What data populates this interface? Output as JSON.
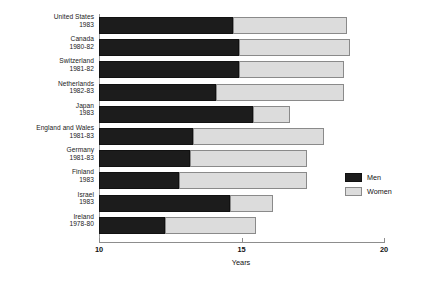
{
  "chart_data": {
    "type": "bar",
    "orientation": "horizontal",
    "stacked": true,
    "title": "",
    "xlabel": "Years",
    "ylabel": "",
    "xlim": [
      10,
      20
    ],
    "xticks": [
      10,
      15,
      20
    ],
    "xtick_labels": [
      "10",
      "15",
      "20"
    ],
    "grid": false,
    "legend_position": "right-inside",
    "categories": [
      "United States 1983",
      "Canada 1980-82",
      "Switzerland 1981-82",
      "Netherlands 1982-83",
      "Japan 1983",
      "England and Wales 1981-83",
      "Germany 1981-83",
      "Finland 1983",
      "Israel 1983",
      "Ireland 1978-80"
    ],
    "category_lines": [
      {
        "country": "United States",
        "period": "1983"
      },
      {
        "country": "Canada",
        "period": "1980-82"
      },
      {
        "country": "Switzerland",
        "period": "1981-82"
      },
      {
        "country": "Netherlands",
        "period": "1982-83"
      },
      {
        "country": "Japan",
        "period": "1983"
      },
      {
        "country": "England and Wales",
        "period": "1981-83"
      },
      {
        "country": "Germany",
        "period": "1981-83"
      },
      {
        "country": "Finland",
        "period": "1983"
      },
      {
        "country": "Israel",
        "period": "1983"
      },
      {
        "country": "Ireland",
        "period": "1978-80"
      }
    ],
    "series": [
      {
        "name": "Men",
        "color": "#1c1c1c",
        "values": [
          14.7,
          14.9,
          14.9,
          14.1,
          15.4,
          13.3,
          13.2,
          12.8,
          14.6,
          12.3
        ]
      },
      {
        "name": "Women",
        "color": "#dcdcdc",
        "values": [
          18.7,
          18.8,
          18.6,
          18.6,
          16.7,
          17.9,
          17.3,
          17.3,
          16.1,
          15.5
        ]
      }
    ],
    "series_note": "Women values are the total (cumulative) bar ends in years; Men values are the black segment ends in years.",
    "legend": [
      {
        "label": "Men",
        "color": "#1c1c1c"
      },
      {
        "label": "Women",
        "color": "#dcdcdc"
      }
    ]
  },
  "axis": {
    "x_title": "Years"
  }
}
